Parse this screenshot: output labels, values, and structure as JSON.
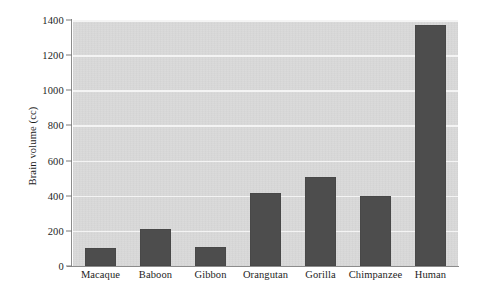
{
  "chart_data": {
    "type": "bar",
    "title": "",
    "xlabel": "",
    "ylabel": "Brain volume (cc)",
    "categories": [
      "Macaque",
      "Baboon",
      "Gibbon",
      "Orangutan",
      "Gorilla",
      "Chimpanzee",
      "Human"
    ],
    "values": [
      100,
      210,
      110,
      415,
      505,
      400,
      1370
    ],
    "ylim": [
      0,
      1400
    ],
    "yticks": [
      0,
      200,
      400,
      600,
      800,
      1000,
      1200,
      1400
    ],
    "ytick_labels": [
      "0",
      "200",
      "400",
      "600",
      "800",
      "1000",
      "1200",
      "1400"
    ],
    "grid": true,
    "grid_axis": "y",
    "legend": null,
    "legend_position": "none",
    "colors": {
      "bar": "#4d4d4d",
      "plot_background": "#d9d9d9",
      "gridline": "#f4f4f4",
      "axis": "#8c8c8c",
      "text": "#1d1d1d",
      "figure_background": "#ffffff"
    }
  }
}
